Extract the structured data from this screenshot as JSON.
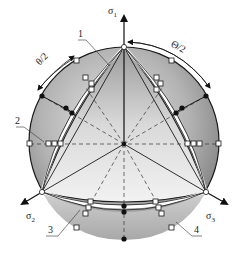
{
  "diagram": {
    "axes": [
      {
        "id": "sigma1",
        "label": "σ",
        "subscript": "1"
      },
      {
        "id": "sigma2",
        "label": "σ",
        "subscript": "2"
      },
      {
        "id": "sigma3",
        "label": "σ",
        "subscript": "3"
      }
    ],
    "angle_labels": [
      {
        "id": "theta-left",
        "text": "θ/2"
      },
      {
        "id": "theta-right",
        "text": "Θ/2"
      }
    ],
    "curve_labels": [
      {
        "id": "curve-1",
        "text": "1"
      },
      {
        "id": "curve-2",
        "text": "2"
      },
      {
        "id": "curve-3",
        "text": "3"
      },
      {
        "id": "curve-4",
        "text": "4"
      }
    ],
    "colors": {
      "outline": "#1a1a1a",
      "fill_dark": "#8c8c8c",
      "fill_mid": "#b5b5b5",
      "fill_light": "#e8e8e8",
      "background": "#ffffff"
    }
  }
}
